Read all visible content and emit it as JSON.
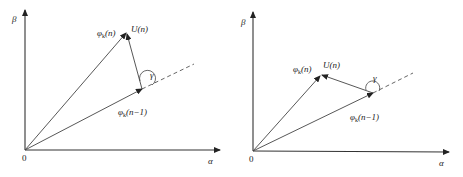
{
  "diagrams": [
    {
      "id": "left",
      "axes": {
        "x_label": "α",
        "y_label": "β",
        "origin_label": "0"
      },
      "vectors": {
        "phi_n": {
          "label_main": "φ",
          "label_sub": "k",
          "label_arg": "(n)"
        },
        "phi_n_minus_1": {
          "label_main": "φ",
          "label_sub": "k",
          "label_arg": "(n−1)"
        },
        "u_n": {
          "label": "U(n)"
        }
      },
      "angle_label": "γ"
    },
    {
      "id": "right",
      "axes": {
        "x_label": "α",
        "y_label": "β",
        "origin_label": "0"
      },
      "vectors": {
        "phi_n": {
          "label_main": "φ",
          "label_sub": "k",
          "label_arg": "(n)"
        },
        "phi_n_minus_1": {
          "label_main": "φ",
          "label_sub": "k",
          "label_arg": "(n−1)"
        },
        "u_n": {
          "label": "U(n)"
        }
      },
      "angle_label": "γ"
    }
  ]
}
